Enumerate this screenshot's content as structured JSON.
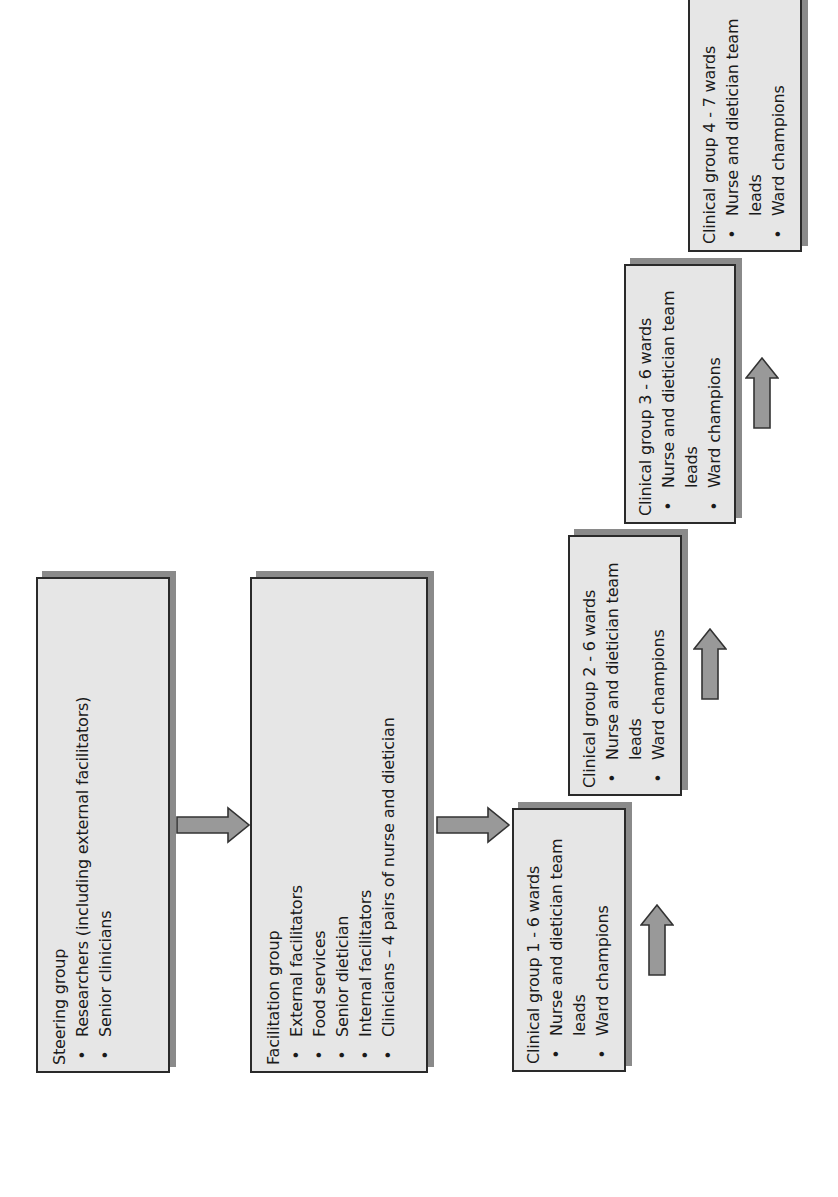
{
  "diagram": {
    "orientation": "rotated -90 degrees",
    "colors": {
      "box_fill": "#e6e6e6",
      "box_border": "#2a2a2a",
      "box_shadow": "#8a8a8a",
      "arrow_fill": "#999999",
      "arrow_border": "#333333"
    },
    "steering_group": {
      "title": "Steering group",
      "items": [
        "Researchers (including external facilitators)",
        "Senior clinicians"
      ]
    },
    "facilitation_group": {
      "title": "Facilitation group",
      "items": [
        "External facilitators",
        "Food services",
        "Senior dietician",
        "Internal facilitators",
        "Clinicians – 4 pairs of nurse and dietician"
      ]
    },
    "clinical_groups": [
      {
        "title": "Clinical group 1 - 6 wards",
        "items": [
          "Nurse and dietician team leads",
          "Ward champions"
        ]
      },
      {
        "title": "Clinical group 2 - 6 wards",
        "items": [
          "Nurse and dietician team leads",
          "Ward champions"
        ]
      },
      {
        "title": "Clinical group 3 - 6 wards",
        "items": [
          "Nurse and dietician team leads",
          "Ward champions"
        ]
      },
      {
        "title": "Clinical group 4 - 7 wards",
        "items": [
          "Nurse and dietician team leads",
          "Ward champions"
        ]
      }
    ],
    "bullet": "•",
    "arrows": [
      {
        "from": "steering_group",
        "to": "facilitation_group",
        "direction": "right"
      },
      {
        "from": "facilitation_group",
        "to": "clinical_group_1",
        "direction": "right"
      },
      {
        "from": "clinical_group_1",
        "to": "clinical_group_2",
        "direction": "up"
      },
      {
        "from": "clinical_group_2",
        "to": "clinical_group_3",
        "direction": "up"
      },
      {
        "from": "clinical_group_3",
        "to": "clinical_group_4",
        "direction": "up"
      }
    ]
  }
}
